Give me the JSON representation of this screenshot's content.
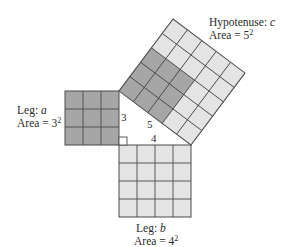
{
  "figure": {
    "leg_a": {
      "label_prefix": "Leg: ",
      "var": "a",
      "area_prefix": "Area = ",
      "area_base": "3",
      "area_exp": "2",
      "side": 3
    },
    "leg_b": {
      "label_prefix": "Leg: ",
      "var": "b",
      "area_prefix": "Area = ",
      "area_base": "4",
      "area_exp": "2",
      "side": 4
    },
    "hypotenuse": {
      "label_prefix": "Hypotenuse: ",
      "var": "c",
      "area_prefix": "Area = ",
      "area_base": "5",
      "area_exp": "2",
      "side": 5
    },
    "side_labels": {
      "a": "3",
      "b": "4",
      "c": "5"
    },
    "colors": {
      "light_cell": "#e4e4e4",
      "dark_cell": "#a6a6a6",
      "grid_line": "#4a4a4a"
    }
  }
}
